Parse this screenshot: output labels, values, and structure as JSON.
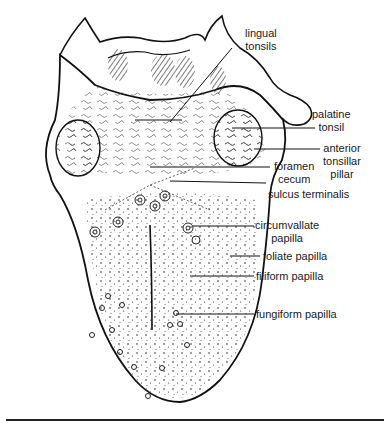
{
  "figure": {
    "labels": {
      "lingual_tonsils": "lingual\ntonsils",
      "palatine_tonsil": "palatine\ntonsil",
      "anterior_tonsillar_pillar": "anterior\ntonsillar\npillar",
      "foramen_cecum": "foramen\ncecum",
      "sulcus_terminalis": "sulcus terminalis",
      "circumvallate_papilla": "circumvallate\npapilla",
      "foliate_papilla": "foliate papilla",
      "filiform_papilla": "filiform papilla",
      "fungiform_papilla": "fungiform papilla"
    }
  }
}
